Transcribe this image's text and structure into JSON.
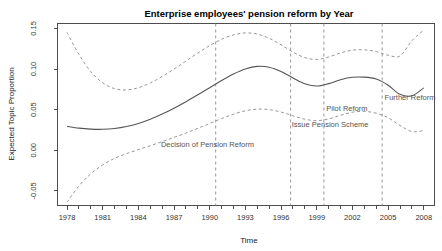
{
  "chart_data": {
    "type": "line",
    "title": "Enterprise employees' pension reform by Year",
    "xlabel": "Time",
    "ylabel": "Expected Topic Proportion",
    "xlim": [
      1977.2,
      2008.9
    ],
    "ylim": [
      -0.068,
      0.156
    ],
    "grid": false,
    "legend": "none",
    "xticks": [
      1978,
      1981,
      1984,
      1987,
      1990,
      1993,
      1996,
      1999,
      2002,
      2005,
      2008
    ],
    "xtick_labels": [
      "1978",
      "1981",
      "1984",
      "1987",
      "1990",
      "1993",
      "1996",
      "1999",
      "2002",
      "2005",
      "2008"
    ],
    "xminor_ticks": [
      1978,
      1979,
      1980,
      1981,
      1982,
      1983,
      1984,
      1985,
      1986,
      1987,
      1988,
      1989,
      1990,
      1991,
      1992,
      1993,
      1994,
      1995,
      1996,
      1997,
      1998,
      1999,
      2000,
      2001,
      2002,
      2003,
      2004,
      2005,
      2006,
      2007,
      2008
    ],
    "yticks": [
      -0.05,
      0.0,
      0.05,
      0.1,
      0.15
    ],
    "ytick_labels": [
      "-0.05",
      "0.00",
      "0.05",
      "0.10",
      "0.15"
    ],
    "series": [
      {
        "name": "Expected Topic Proportion (mean)",
        "style": "solid",
        "x": [
          1978.0,
          1979.0,
          1980.0,
          1981.0,
          1982.0,
          1983.0,
          1984.0,
          1985.0,
          1986.0,
          1987.0,
          1988.0,
          1989.0,
          1990.0,
          1991.0,
          1992.0,
          1993.0,
          1994.0,
          1995.0,
          1996.0,
          1997.0,
          1998.0,
          1999.0,
          2000.0,
          2001.0,
          2002.0,
          2003.0,
          2004.0,
          2005.0,
          2006.0,
          2007.0,
          2008.0
        ],
        "values": [
          0.0295,
          0.0272,
          0.026,
          0.0258,
          0.0268,
          0.0292,
          0.033,
          0.0382,
          0.0446,
          0.0518,
          0.0598,
          0.0682,
          0.077,
          0.0858,
          0.0938,
          0.1,
          0.1032,
          0.1022,
          0.0968,
          0.089,
          0.0818,
          0.079,
          0.082,
          0.0868,
          0.0898,
          0.09,
          0.0876,
          0.08,
          0.0688,
          0.067,
          0.0768
        ]
      },
      {
        "name": "Upper 95% confidence bound",
        "style": "dashed",
        "x": [
          1978.0,
          1979.0,
          1980.0,
          1981.0,
          1982.0,
          1983.0,
          1984.0,
          1985.0,
          1986.0,
          1987.0,
          1988.0,
          1989.0,
          1990.0,
          1991.0,
          1992.0,
          1993.0,
          1994.0,
          1995.0,
          1996.0,
          1997.0,
          1998.0,
          1999.0,
          2000.0,
          2001.0,
          2002.0,
          2003.0,
          2004.0,
          2005.0,
          2006.0,
          2007.0,
          2008.0
        ],
        "values": [
          0.145,
          0.118,
          0.0968,
          0.083,
          0.0758,
          0.0742,
          0.077,
          0.0828,
          0.0908,
          0.1,
          0.1098,
          0.1196,
          0.1288,
          0.1366,
          0.142,
          0.1444,
          0.143,
          0.1378,
          0.1298,
          0.1208,
          0.114,
          0.1118,
          0.1148,
          0.1198,
          0.1232,
          0.1236,
          0.1214,
          0.117,
          0.116,
          0.1348,
          0.148
        ]
      },
      {
        "name": "Lower 95% confidence bound",
        "style": "dashed",
        "x": [
          1978.0,
          1979.0,
          1980.0,
          1981.0,
          1982.0,
          1983.0,
          1984.0,
          1985.0,
          1986.0,
          1987.0,
          1988.0,
          1989.0,
          1990.0,
          1991.0,
          1992.0,
          1993.0,
          1994.0,
          1995.0,
          1996.0,
          1997.0,
          1998.0,
          1999.0,
          2000.0,
          2001.0,
          2002.0,
          2003.0,
          2004.0,
          2005.0,
          2006.0,
          2007.0,
          2008.0
        ],
        "values": [
          -0.064,
          -0.044,
          -0.029,
          -0.018,
          -0.01,
          -0.0042,
          0.0008,
          0.0056,
          0.0106,
          0.0158,
          0.0212,
          0.027,
          0.033,
          0.039,
          0.0444,
          0.0486,
          0.0506,
          0.05,
          0.047,
          0.0424,
          0.0382,
          0.0364,
          0.0386,
          0.043,
          0.0468,
          0.0478,
          0.0456,
          0.04,
          0.0306,
          0.023,
          0.0242
        ]
      }
    ],
    "annotations": [
      {
        "label": "Decision of Pension Reform",
        "x": 1990.5,
        "label_x": 1985.9,
        "label_y": 0.0043,
        "anchor": "start"
      },
      {
        "label": "Issue Pension Scheme",
        "x": 1996.8,
        "label_x": 1996.9,
        "label_y": 0.029,
        "anchor": "start"
      },
      {
        "label": "Pilot Reform",
        "x": 1999.6,
        "label_x": 1999.8,
        "label_y": 0.048,
        "anchor": "start"
      },
      {
        "language_note": "",
        "label": "Further Reform",
        "x": 2004.5,
        "label_x": 2004.7,
        "label_y": 0.0615,
        "anchor": "start"
      }
    ],
    "colors": {
      "mean_line": "#555555",
      "ci_line": "#8a8a8a",
      "event_line": "#8a8a8a",
      "axis": "#4d4d4d",
      "text": "#333333",
      "background": "#ffffff"
    }
  }
}
